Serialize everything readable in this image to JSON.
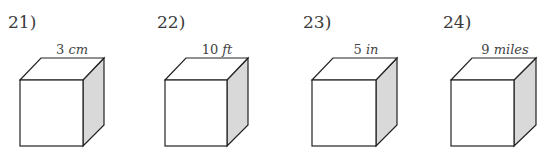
{
  "problems": [
    {
      "number": "21)",
      "value": "3",
      "unit": "cm",
      "num_x": 8,
      "fx": 20
    },
    {
      "number": "22)",
      "value": "10",
      "unit": "ft",
      "num_x": 157,
      "fx": 165
    },
    {
      "number": "23)",
      "value": "5",
      "unit": "in",
      "num_x": 303,
      "fx": 312
    },
    {
      "number": "24)",
      "value": "9",
      "unit": "miles",
      "num_x": 443,
      "fx": 451
    }
  ],
  "colors": {
    "edge": "#222222",
    "side_face": "#d9d9d9",
    "front_face": "#ffffff"
  }
}
